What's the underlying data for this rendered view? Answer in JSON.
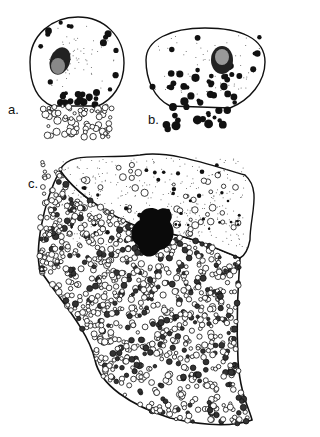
{
  "figure": {
    "panels": [
      {
        "label": "a.",
        "description": "round cell with nucleus and clear vesicles emerging below"
      },
      {
        "label": "b.",
        "description": "oval cell with nucleus and dark granules emerging below"
      },
      {
        "label": "c.",
        "description": "large cell with dark nucleus and mass of granules"
      }
    ],
    "colors": {
      "ink": "#111111",
      "paper": "#ffffff",
      "stipple": "#555555"
    }
  }
}
